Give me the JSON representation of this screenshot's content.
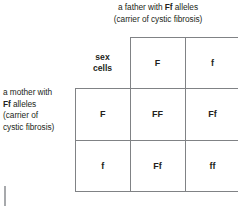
{
  "diagram": {
    "type": "punnett-square",
    "title_top": {
      "line1_prefix": "a father with ",
      "line1_genotype": "Ff",
      "line1_suffix": " alleles",
      "line2": "(carrier of cystic fibrosis)"
    },
    "title_left": {
      "line1": "a mother with",
      "line2_genotype": "Ff",
      "line2_suffix": " alleles",
      "line3": "(carrier of",
      "line4": "cystic fibrosis)"
    },
    "corner_label_line1": "sex",
    "corner_label_line2": "cells",
    "father_alleles": [
      "F",
      "f"
    ],
    "mother_alleles": [
      "F",
      "f"
    ],
    "offspring": [
      [
        "FF",
        "Ff"
      ],
      [
        "Ff",
        "ff"
      ]
    ],
    "colors": {
      "text": "#231f20",
      "grid_line": "#808285",
      "background": "#ffffff",
      "tick": "#a7a9ac"
    }
  }
}
